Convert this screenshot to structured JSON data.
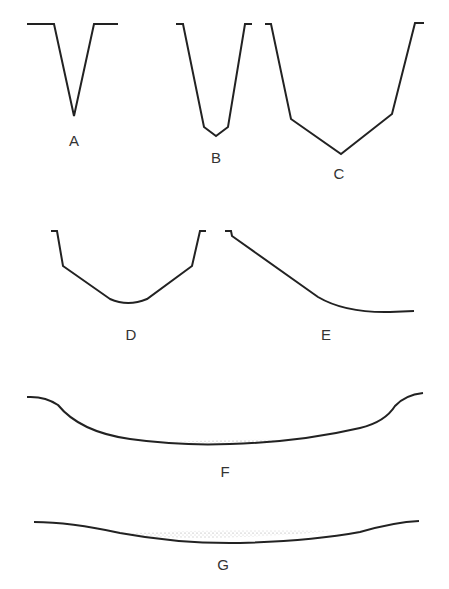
{
  "diagram": {
    "profiles": [
      {
        "id": "A",
        "label": "A"
      },
      {
        "id": "B",
        "label": "B"
      },
      {
        "id": "C",
        "label": "C"
      },
      {
        "id": "D",
        "label": "D"
      },
      {
        "id": "E",
        "label": "E"
      },
      {
        "id": "F",
        "label": "F"
      },
      {
        "id": "G",
        "label": "G"
      }
    ],
    "colors": {
      "line": "#222222",
      "label": "#333333",
      "stipple": "#888888"
    }
  }
}
